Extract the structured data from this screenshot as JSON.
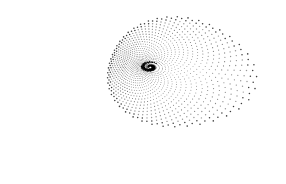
{
  "figure": {
    "width": 286,
    "height": 184,
    "background": "#ffffff",
    "dot_color": "#000000",
    "center": [
      150,
      67
    ],
    "rings": 34,
    "arms": 44,
    "twist": 2.4
  }
}
